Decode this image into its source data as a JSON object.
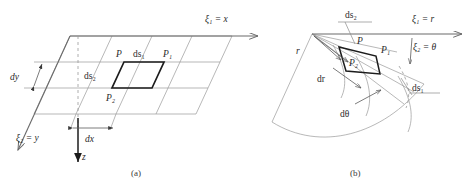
{
  "figure": {
    "background_color": "#ffffff",
    "line_color": "#9a9a9a",
    "accent_color": "#1c1c1c",
    "panels": [
      {
        "id": "a",
        "caption": "(a)",
        "coordinate_system": "cartesian",
        "axis_labels": {
          "xi1": "ξ₁ = x",
          "xi2": "ξ₂ = y",
          "z": "z"
        },
        "points": {
          "p": "P",
          "p1": "P₁",
          "p2": "P₂"
        },
        "arc_labels": {
          "ds1": "ds₁",
          "ds2": "ds₂"
        },
        "dimensions": {
          "dx": "dx",
          "dy": "dy"
        }
      },
      {
        "id": "b",
        "caption": "(b)",
        "coordinate_system": "polar",
        "axis_labels": {
          "xi1": "ξ₁ = r",
          "xi2": "ξ₂ = θ"
        },
        "points": {
          "p": "P",
          "p1": "P₁",
          "p2": "P₂"
        },
        "arc_labels": {
          "ds1": "ds₁",
          "ds2": "ds₂"
        },
        "dimensions": {
          "r": "r",
          "dr": "dr",
          "dtheta": "dθ"
        }
      }
    ]
  }
}
